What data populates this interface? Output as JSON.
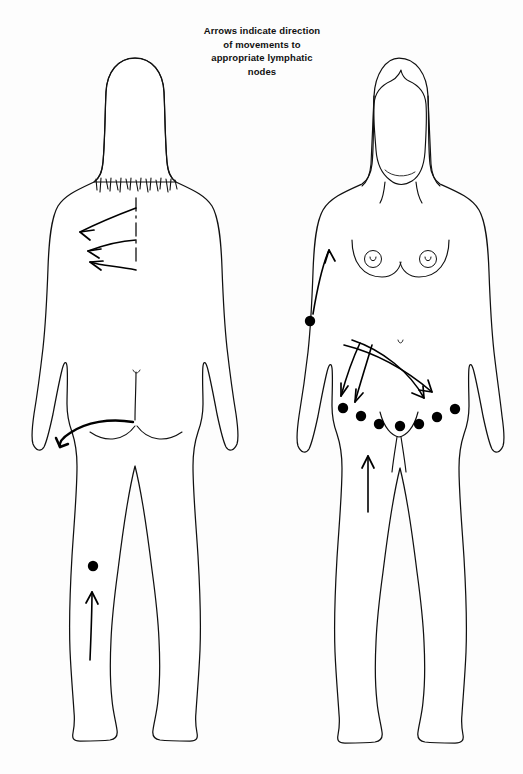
{
  "page": {
    "background_color": "#fdfdfd",
    "ink_color": "#111111",
    "width": 523,
    "height": 774
  },
  "caption": {
    "line1": "Arrows indicate direction",
    "line2": "of movements to",
    "line3": "appropriate lymphatic",
    "line4": "nodes"
  },
  "figures": [
    {
      "id": "posterior-figure",
      "view_label": "posterior",
      "position": "left",
      "features": {
        "hair": "long hair to shoulders with ragged fringe ends",
        "spine": "dashed midline spine marker",
        "feet": "heels shown, viewed from behind"
      },
      "arrows": [
        {
          "name": "upper-back-to-axilla-arrow-1",
          "from": "spine upper thoracic",
          "to": "left axilla",
          "direction": "left-upward"
        },
        {
          "name": "upper-back-to-axilla-arrow-2",
          "from": "spine mid thoracic",
          "to": "left axilla",
          "direction": "left"
        },
        {
          "name": "upper-back-to-axilla-arrow-3",
          "from": "spine lower thoracic",
          "to": "left axilla",
          "direction": "left-downward"
        },
        {
          "name": "buttock-to-inguinal-arrow",
          "from": "sacral and gluteal region",
          "to": "left inguinal region",
          "direction": "left, hooking downward"
        },
        {
          "name": "lower-leg-to-popliteal-arrow",
          "from": "posterior calf",
          "to": "popliteal node",
          "direction": "upward"
        }
      ],
      "nodes": [
        {
          "name": "popliteal-node",
          "region": "behind left knee",
          "count": 1
        }
      ]
    },
    {
      "id": "anterior-figure",
      "view_label": "anterior",
      "position": "right",
      "features": {
        "hair": "long hair framing face with widow's peak",
        "breasts": "both areolae with nipple marks shown",
        "feet": "toes shown, viewed from front"
      },
      "arrows": [
        {
          "name": "flank-to-axilla-arrow",
          "from": "left lateral flank node",
          "to": "left axilla",
          "direction": "upward"
        },
        {
          "name": "abdomen-to-inguinal-arrow-left-short",
          "from": "lower abdomen midline",
          "to": "left inguinal nodes",
          "direction": "down-left"
        },
        {
          "name": "abdomen-to-inguinal-arrow-left-long",
          "from": "lower abdomen midline",
          "to": "left inguinal nodes",
          "direction": "down-left"
        },
        {
          "name": "abdomen-to-inguinal-arrow-right-arc-1",
          "from": "left upper abdomen",
          "to": "right inguinal nodes",
          "direction": "sweeping arc to lower right"
        },
        {
          "name": "abdomen-to-inguinal-arrow-right-arc-2",
          "from": "left upper abdomen",
          "to": "right inguinal nodes",
          "direction": "sweeping arc to lower right"
        },
        {
          "name": "thigh-to-inguinal-arrow",
          "from": "anterior left thigh",
          "to": "inguinal nodes",
          "direction": "upward"
        }
      ],
      "nodes": [
        {
          "name": "lateral-flank-node",
          "region": "left lateral trunk",
          "count": 1
        },
        {
          "name": "inguinal-node-group",
          "region": "groin, arranged in an arc across both sides",
          "count": 7
        }
      ]
    }
  ],
  "legend": {
    "node_symbol": "filled black circle = lymph node",
    "arrow_symbol": "arrow = direction of lymph movement"
  }
}
